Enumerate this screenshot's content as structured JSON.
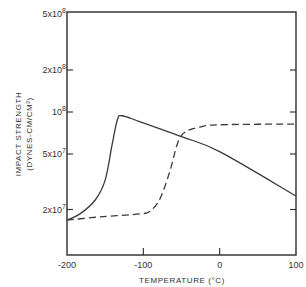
{
  "chart_data": {
    "type": "line",
    "title": "",
    "xlabel": "TEMPERATURE (°C)",
    "ylabel": "IMPACT STRENGTH",
    "ylabel_units": "(DYNES-CM/CM²)",
    "xlim": [
      -200,
      100
    ],
    "ylim": [
      9400000.0,
      500000000.0
    ],
    "yscale": "log",
    "grid": false,
    "legend": null,
    "x_ticks": [
      {
        "value": -200,
        "label": "-200"
      },
      {
        "value": -100,
        "label": "-100"
      },
      {
        "value": 0,
        "label": "0"
      },
      {
        "value": 100,
        "label": "100"
      }
    ],
    "y_ticks": [
      {
        "value": 500000000,
        "label": "5x10",
        "exp": "8"
      },
      {
        "value": 200000000,
        "label": "2x10",
        "exp": "8"
      },
      {
        "value": 100000000,
        "label": "10",
        "exp": "8"
      },
      {
        "value": 50000000,
        "label": "5x10",
        "exp": "7"
      },
      {
        "value": 20000000,
        "label": "2x10",
        "exp": "7"
      }
    ],
    "series": [
      {
        "name": "solid",
        "style": "solid",
        "x": [
          -200,
          -183,
          -163,
          -150,
          -141,
          -134,
          -128,
          -104,
          -48,
          0,
          100
        ],
        "values": [
          16800000.0,
          18600000.0,
          23400000.0,
          32500000.0,
          58000000.0,
          88000000.0,
          94000000.0,
          85000000.0,
          66000000.0,
          52000000.0,
          25000000.0
        ]
      },
      {
        "name": "dashed",
        "style": "dashed",
        "x": [
          -200,
          -157,
          -104,
          -91,
          -78,
          -65,
          -55,
          -45,
          -26,
          0,
          100
        ],
        "values": [
          16800000.0,
          17700000.0,
          18600000.0,
          19500000.0,
          24000000.0,
          38000000.0,
          60000000.0,
          72000000.0,
          78000000.0,
          81000000.0,
          82000000.0
        ]
      }
    ]
  },
  "colors": {
    "axis": "#2a2a2a",
    "line": "#3a3a3a",
    "background": "#ffffff"
  }
}
